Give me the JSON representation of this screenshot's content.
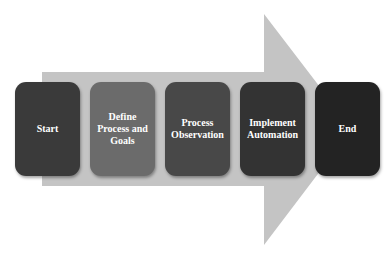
{
  "diagram": {
    "type": "process-flow",
    "arrow": {
      "color": "#c4c4c4",
      "direction": "right"
    },
    "steps": [
      {
        "id": "start",
        "label": "Start",
        "color": "#3a3a3a"
      },
      {
        "id": "define",
        "label": "Define\nProcess and\nGoals",
        "color": "#6b6b6b"
      },
      {
        "id": "observe",
        "label": "Process\nObservation",
        "color": "#484848"
      },
      {
        "id": "implement",
        "label": "Implement\nAutomation",
        "color": "#333333"
      },
      {
        "id": "end",
        "label": "End",
        "color": "#232323"
      }
    ]
  }
}
